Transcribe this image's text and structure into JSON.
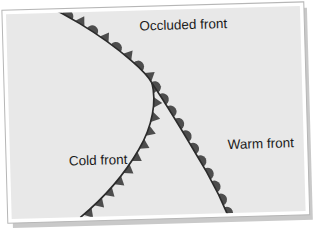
{
  "figure": {
    "canvas": {
      "width": 317,
      "height": 241
    },
    "panel": {
      "fill_color": "#e8e8e8",
      "border_color": "#ffffff",
      "edge_color": "#b6b6b6",
      "shadow_color": "#c9c9c9",
      "rotation_degrees": -1.6
    },
    "line_color": "#2b2b2b",
    "symbol_color": "#4d4d4d",
    "labels": [
      {
        "id": "occluded",
        "text": "Occluded front",
        "x": 186,
        "y": 30,
        "anchor": "middle"
      },
      {
        "id": "cold",
        "text": "Cold front",
        "x": 97,
        "y": 163,
        "anchor": "middle"
      },
      {
        "id": "warm",
        "text": "Warm front",
        "x": 260,
        "y": 151,
        "anchor": "middle"
      }
    ],
    "fronts": [
      {
        "id": "occluded-front",
        "name": "Occluded front",
        "symbol_type": "alternating-triangle-semicircle",
        "symbol_side": "right",
        "path": "M 27 -8 C 62 6 105 34 133 60 C 144 70 150 77 153 83"
      },
      {
        "id": "cold-front",
        "name": "Cold front",
        "symbol_type": "triangle",
        "symbol_side": "right",
        "path": "M 153 83 C 157 101 153 125 138 149 C 122 175 101 197 78 215"
      },
      {
        "id": "warm-front",
        "name": "Warm front",
        "symbol_type": "semicircle",
        "symbol_side": "right",
        "path": "M 153 83 C 168 106 188 142 205 173 C 214 190 221 206 226 219"
      }
    ],
    "legend_note": "Triangles denote the cold front, semicircles denote the warm front, alternating symbols denote the occlusion."
  }
}
